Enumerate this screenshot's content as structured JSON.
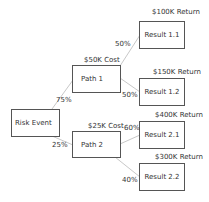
{
  "diagram": {
    "type": "decision-tree",
    "colors": {
      "edge": "#c8c8c8",
      "border": "#555555",
      "text": "#333333"
    },
    "nodes": {
      "root": {
        "label": "Risk Event"
      },
      "path1": {
        "label": "Path 1",
        "cost": "$50K Cost"
      },
      "path2": {
        "label": "Path 2",
        "cost": "$25K Cost"
      },
      "result11": {
        "label": "Result 1.1",
        "return": "$100K Return"
      },
      "result12": {
        "label": "Result 1.2",
        "return": "$150K Return"
      },
      "result21": {
        "label": "Result 2.1",
        "return": "$400K Return"
      },
      "result22": {
        "label": "Result 2.2",
        "return": "$300K Return"
      }
    },
    "edges": {
      "root_path1": "75%",
      "root_path2": "25%",
      "path1_result11": "50%",
      "path1_result12": "50%",
      "path2_result21": "60%",
      "path2_result22": "40%"
    }
  }
}
